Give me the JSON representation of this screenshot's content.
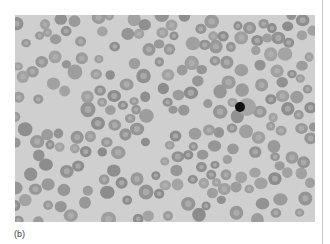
{
  "figure": {
    "caption": "(b)",
    "image_description": "Light micrograph of a peripheral blood smear showing many red blood cells of varying sizes and shapes, with one small dark-staining cell",
    "colors": {
      "background": "#cfcfcf",
      "cell": "#9a9a9a",
      "cell_center": "#b4b4b4",
      "dark_cell": "#111111",
      "divider": "#c8c8c8"
    }
  }
}
